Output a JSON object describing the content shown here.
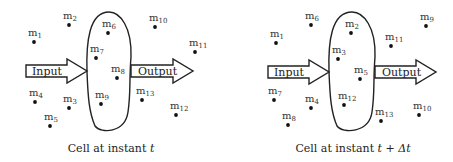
{
  "panels": [
    {
      "id": "t",
      "caption_prefix": "Cell at instant ",
      "caption_var": "t",
      "input_label": "Input",
      "output_label": "Output",
      "cell": {
        "left": 87,
        "right": 131,
        "top": 12,
        "bottom": 132
      },
      "input_arrow": {
        "x1": 26,
        "x2": 87,
        "cy": 71
      },
      "output_arrow": {
        "x1": 131,
        "x2": 193,
        "cy": 71
      },
      "caption_x": 111,
      "particles": [
        {
          "name": "m",
          "sub": "1",
          "x": 34,
          "y": 42
        },
        {
          "name": "m",
          "sub": "2",
          "x": 69,
          "y": 25
        },
        {
          "name": "m",
          "sub": "3",
          "x": 69,
          "y": 108
        },
        {
          "name": "m",
          "sub": "4",
          "x": 35,
          "y": 102
        },
        {
          "name": "m",
          "sub": "5",
          "x": 50,
          "y": 126
        },
        {
          "name": "m",
          "sub": "6",
          "x": 108,
          "y": 33
        },
        {
          "name": "m",
          "sub": "7",
          "x": 96,
          "y": 58
        },
        {
          "name": "m",
          "sub": "8",
          "x": 117,
          "y": 78
        },
        {
          "name": "m",
          "sub": "9",
          "x": 101,
          "y": 104
        },
        {
          "name": "m",
          "sub": "10",
          "x": 155,
          "y": 27
        },
        {
          "name": "m",
          "sub": "11",
          "x": 195,
          "y": 52
        },
        {
          "name": "m",
          "sub": "12",
          "x": 176,
          "y": 115
        },
        {
          "name": "m",
          "sub": "13",
          "x": 142,
          "y": 100
        }
      ]
    },
    {
      "id": "t_plus_dt",
      "caption_prefix": "Cell at instant ",
      "caption_var": "t + Δt",
      "input_label": "Input",
      "output_label": "Output",
      "cell": {
        "left": 329,
        "right": 375,
        "top": 12,
        "bottom": 132
      },
      "input_arrow": {
        "x1": 268,
        "x2": 329,
        "cy": 72
      },
      "output_arrow": {
        "x1": 375,
        "x2": 436,
        "cy": 72
      },
      "caption_x": 353,
      "particles": [
        {
          "name": "m",
          "sub": "1",
          "x": 276,
          "y": 43
        },
        {
          "name": "m",
          "sub": "2",
          "x": 351,
          "y": 33
        },
        {
          "name": "m",
          "sub": "3",
          "x": 338,
          "y": 59
        },
        {
          "name": "m",
          "sub": "4",
          "x": 311,
          "y": 108
        },
        {
          "name": "m",
          "sub": "5",
          "x": 360,
          "y": 79
        },
        {
          "name": "m",
          "sub": "6",
          "x": 311,
          "y": 25
        },
        {
          "name": "m",
          "sub": "7",
          "x": 274,
          "y": 100
        },
        {
          "name": "m",
          "sub": "8",
          "x": 288,
          "y": 125
        },
        {
          "name": "m",
          "sub": "9",
          "x": 426,
          "y": 26
        },
        {
          "name": "m",
          "sub": "10",
          "x": 419,
          "y": 115
        },
        {
          "name": "m",
          "sub": "11",
          "x": 391,
          "y": 46
        },
        {
          "name": "m",
          "sub": "12",
          "x": 344,
          "y": 105
        },
        {
          "name": "m",
          "sub": "13",
          "x": 381,
          "y": 121
        }
      ]
    }
  ],
  "colors": {
    "stroke": "#222222",
    "dot": "#111111",
    "text": "#333333"
  }
}
